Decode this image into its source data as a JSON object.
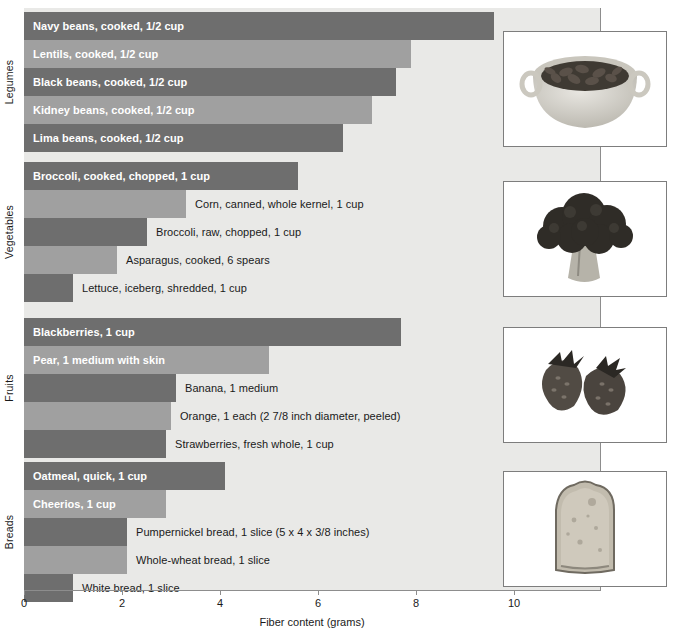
{
  "chart_data": {
    "type": "bar",
    "orientation": "horizontal",
    "title": "",
    "xlabel": "Fiber content (grams)",
    "ylabel": "",
    "xlim": [
      0,
      11.75
    ],
    "xticks": [
      "0",
      "2",
      "4",
      "6",
      "8",
      "10"
    ],
    "xtick_values": [
      0,
      2,
      4,
      6,
      8,
      10
    ],
    "grid": false,
    "legend": "none",
    "groups": [
      {
        "name": "Legumes",
        "photo": "bowl-of-beans-photo",
        "items": [
          {
            "label": "Navy beans, cooked, 1/2 cup",
            "value": 9.6,
            "label_position": "inside",
            "shade": "dark"
          },
          {
            "label": "Lentils, cooked, 1/2 cup",
            "value": 7.9,
            "label_position": "inside",
            "shade": "light"
          },
          {
            "label": "Black beans, cooked, 1/2 cup",
            "value": 7.6,
            "label_position": "inside",
            "shade": "dark"
          },
          {
            "label": "Kidney beans, cooked, 1/2 cup",
            "value": 7.1,
            "label_position": "inside",
            "shade": "light"
          },
          {
            "label": "Lima beans, cooked, 1/2 cup",
            "value": 6.5,
            "label_position": "inside",
            "shade": "dark"
          }
        ]
      },
      {
        "name": "Vegetables",
        "photo": "broccoli-photo",
        "items": [
          {
            "label": "Broccoli, cooked, chopped, 1 cup",
            "value": 5.6,
            "label_position": "inside",
            "shade": "dark"
          },
          {
            "label": "Corn, canned, whole kernel, 1 cup",
            "value": 3.3,
            "label_position": "outside",
            "shade": "light"
          },
          {
            "label": "Broccoli, raw, chopped, 1 cup",
            "value": 2.5,
            "label_position": "outside",
            "shade": "dark"
          },
          {
            "label": "Asparagus, cooked, 6 spears",
            "value": 1.9,
            "label_position": "outside",
            "shade": "light"
          },
          {
            "label": "Lettuce, iceberg, shredded, 1 cup",
            "value": 1.0,
            "label_position": "outside",
            "shade": "dark"
          }
        ]
      },
      {
        "name": "Fruits",
        "photo": "strawberries-photo",
        "items": [
          {
            "label": "Blackberries, 1 cup",
            "value": 7.7,
            "label_position": "inside",
            "shade": "dark"
          },
          {
            "label": "Pear, 1 medium with skin",
            "value": 5.0,
            "label_position": "inside",
            "shade": "light"
          },
          {
            "label": "Banana, 1 medium",
            "value": 3.1,
            "label_position": "outside",
            "shade": "dark"
          },
          {
            "label": "Orange, 1 each (2 7/8 inch diameter, peeled)",
            "value": 3.0,
            "label_position": "outside",
            "shade": "light"
          },
          {
            "label": "Strawberries, fresh whole, 1 cup",
            "value": 2.9,
            "label_position": "outside",
            "shade": "dark"
          }
        ]
      },
      {
        "name": "Breads",
        "photo": "bread-slice-photo",
        "items": [
          {
            "label": "Oatmeal, quick, 1 cup",
            "value": 4.1,
            "label_position": "inside",
            "shade": "dark"
          },
          {
            "label": "Cheerios, 1 cup",
            "value": 2.9,
            "label_position": "inside",
            "shade": "light"
          },
          {
            "label": "Pumpernickel bread, 1 slice (5 x 4 x 3/8 inches)",
            "value": 2.1,
            "label_position": "outside",
            "shade": "dark"
          },
          {
            "label": "Whole-wheat bread, 1 slice",
            "value": 2.1,
            "label_position": "outside",
            "shade": "light"
          },
          {
            "label": "White bread, 1 slice",
            "value": 1.0,
            "label_position": "outside",
            "shade": "dark"
          }
        ]
      }
    ],
    "colors": {
      "bar_dark": "#6e6e6e",
      "bar_light": "#a0a0a0",
      "plot_background": "#e9e9e7",
      "axis": "#8d8d8d",
      "label_inside": "#ffffff",
      "label_outside": "#1a1a1a"
    }
  }
}
